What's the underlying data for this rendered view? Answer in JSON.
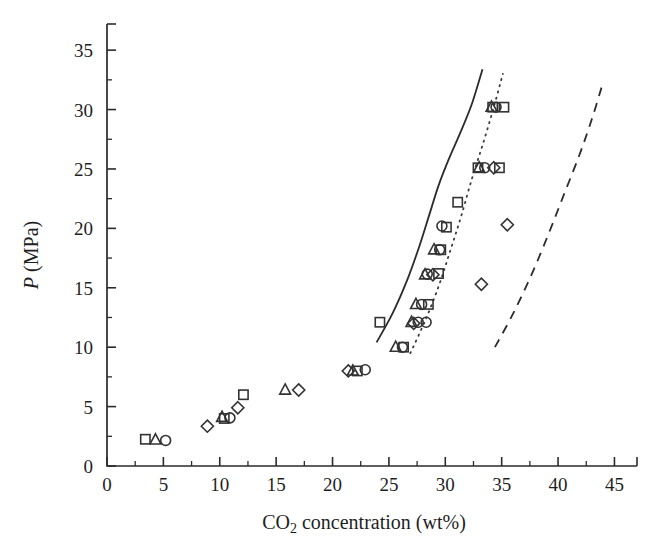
{
  "chart_data": {
    "type": "scatter",
    "title": "",
    "xlabel": "CO2 concentration (wt%)",
    "xlabel_parts": {
      "pre": "CO",
      "sub": "2",
      "post": " concentration (wt%)"
    },
    "ylabel": "P (MPa)",
    "ylabel_parts": {
      "italic": "P",
      "rest": " (MPa)"
    },
    "xlim": [
      0,
      47
    ],
    "ylim": [
      0,
      37.2
    ],
    "xticks": [
      0,
      5,
      10,
      15,
      20,
      25,
      30,
      35,
      40,
      45
    ],
    "yticks": [
      0,
      5,
      10,
      15,
      20,
      25,
      30,
      35
    ],
    "xtick_labels": [
      "0",
      "5",
      "10",
      "15",
      "20",
      "25",
      "30",
      "35",
      "40",
      "45"
    ],
    "ytick_labels": [
      "0",
      "5",
      "10",
      "15",
      "20",
      "25",
      "30",
      "35"
    ],
    "xminor_step": 2.5,
    "yminor_step": 2.5,
    "grid": false,
    "legend_position": "none",
    "marker_colors": {
      "stroke": "#333333",
      "fill": "none"
    },
    "line_colors": {
      "solid": "#2b2b2b",
      "dotted": "#3a3a3a",
      "dashed": "#2b2b2b"
    },
    "series": [
      {
        "name": "squares",
        "marker": "square",
        "points": [
          [
            3.4,
            2.25
          ],
          [
            10.4,
            4.0
          ],
          [
            12.1,
            6.0
          ],
          [
            22.2,
            8.0
          ],
          [
            24.2,
            12.1
          ],
          [
            26.3,
            10.0
          ],
          [
            28.5,
            13.6
          ],
          [
            29.4,
            16.2
          ],
          [
            30.1,
            20.1
          ],
          [
            31.1,
            22.2
          ],
          [
            32.9,
            25.1
          ],
          [
            34.8,
            25.1
          ],
          [
            35.2,
            30.2
          ],
          [
            34.2,
            30.2
          ],
          [
            29.6,
            18.2
          ]
        ]
      },
      {
        "name": "triangles",
        "marker": "triangle",
        "points": [
          [
            4.3,
            2.2
          ],
          [
            10.2,
            4.1
          ],
          [
            15.8,
            6.4
          ],
          [
            21.8,
            8.0
          ],
          [
            25.6,
            10.0
          ],
          [
            27.0,
            12.1
          ],
          [
            28.2,
            16.1
          ],
          [
            27.4,
            13.6
          ],
          [
            29.0,
            18.2
          ],
          [
            33.0,
            25.1
          ],
          [
            34.1,
            30.2
          ]
        ]
      },
      {
        "name": "circles",
        "marker": "circle",
        "points": [
          [
            5.2,
            2.15
          ],
          [
            10.9,
            4.05
          ],
          [
            22.9,
            8.1
          ],
          [
            26.2,
            10.0
          ],
          [
            27.6,
            12.1
          ],
          [
            28.3,
            12.1
          ],
          [
            28.4,
            16.15
          ],
          [
            27.9,
            13.6
          ],
          [
            29.5,
            18.2
          ],
          [
            29.7,
            20.2
          ],
          [
            33.5,
            25.1
          ],
          [
            34.5,
            30.2
          ]
        ]
      },
      {
        "name": "diamonds",
        "marker": "diamond",
        "points": [
          [
            8.9,
            3.35
          ],
          [
            11.6,
            4.9
          ],
          [
            17.0,
            6.4
          ],
          [
            21.4,
            8.0
          ],
          [
            27.2,
            12.0
          ],
          [
            28.9,
            16.1
          ],
          [
            33.2,
            15.3
          ],
          [
            35.5,
            20.3
          ],
          [
            34.3,
            25.1
          ]
        ]
      }
    ],
    "curves": [
      {
        "name": "model-solid",
        "style": "solid",
        "points": [
          [
            23.9,
            10.4
          ],
          [
            25.3,
            12.8
          ],
          [
            26.6,
            15.6
          ],
          [
            27.7,
            18.5
          ],
          [
            28.6,
            21.2
          ],
          [
            29.4,
            23.6
          ],
          [
            30.3,
            25.8
          ],
          [
            31.4,
            28.2
          ],
          [
            32.4,
            30.6
          ],
          [
            33.3,
            33.4
          ]
        ]
      },
      {
        "name": "model-dotted",
        "style": "dotted",
        "points": [
          [
            26.9,
            9.5
          ],
          [
            28.2,
            12.2
          ],
          [
            29.4,
            15.1
          ],
          [
            30.4,
            18.0
          ],
          [
            31.4,
            21.0
          ],
          [
            32.4,
            24.3
          ],
          [
            33.4,
            27.3
          ],
          [
            34.3,
            30.2
          ],
          [
            35.1,
            33.0
          ]
        ]
      },
      {
        "name": "model-dashed",
        "style": "dashed",
        "points": [
          [
            34.4,
            10.0
          ],
          [
            36.0,
            12.8
          ],
          [
            37.6,
            16.0
          ],
          [
            39.1,
            19.4
          ],
          [
            40.5,
            22.8
          ],
          [
            41.9,
            26.2
          ],
          [
            43.0,
            29.2
          ],
          [
            43.9,
            32.0
          ]
        ]
      }
    ]
  }
}
